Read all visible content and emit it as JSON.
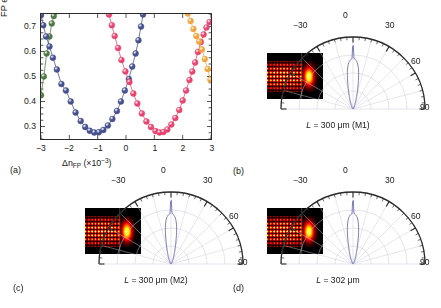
{
  "figure": {
    "panels": [
      "a",
      "b",
      "c",
      "d"
    ],
    "panel_labels": {
      "a": "(a)",
      "b": "(b)",
      "c": "(c)",
      "d": "(d)"
    }
  },
  "chart_data": [
    {
      "panel": "a",
      "type": "scatter",
      "title": "",
      "xlabel": "Δn_FP (×10⁻³)",
      "ylabel": "FP energy ratio R",
      "xlim": [
        -3,
        3
      ],
      "ylim": [
        0.25,
        0.75
      ],
      "xticks": [
        -3,
        -2,
        -1,
        0,
        1,
        2,
        3
      ],
      "yticks": [
        0.3,
        0.4,
        0.5,
        0.6,
        0.7
      ],
      "grid": false,
      "legend": "none",
      "series": [
        {
          "name": "green-branch",
          "color": "#4f7a43",
          "marker": "sphere",
          "x": [
            -3.0,
            -2.9,
            -2.8,
            -2.7,
            -2.62,
            -2.55,
            -2.48
          ],
          "y": [
            0.425,
            0.5,
            0.592,
            0.66,
            0.712,
            0.742,
            0.76
          ]
        },
        {
          "name": "blue-branch",
          "color": "#46508f",
          "marker": "sphere",
          "x": [
            -3.0,
            -2.92,
            -2.82,
            -2.7,
            -2.58,
            -2.44,
            -2.28,
            -2.12,
            -1.95,
            -1.78,
            -1.6,
            -1.44,
            -1.28,
            -1.12,
            -0.96,
            -0.8,
            -0.64,
            -0.48,
            -0.32,
            -0.18,
            -0.04,
            0.1,
            0.22,
            0.34,
            0.44,
            0.53,
            0.6
          ],
          "y": [
            0.745,
            0.705,
            0.66,
            0.62,
            0.575,
            0.528,
            0.47,
            0.444,
            0.4,
            0.356,
            0.322,
            0.298,
            0.283,
            0.276,
            0.277,
            0.286,
            0.304,
            0.33,
            0.362,
            0.4,
            0.444,
            0.49,
            0.54,
            0.592,
            0.645,
            0.7,
            0.748
          ]
        },
        {
          "name": "pink-branch",
          "color": "#e8446f",
          "marker": "sphere",
          "x": [
            -0.6,
            -0.5,
            -0.4,
            -0.28,
            -0.16,
            -0.02,
            0.12,
            0.26,
            0.4,
            0.56,
            0.72,
            0.88,
            1.04,
            1.18,
            1.32,
            1.46,
            1.6,
            1.74,
            1.88,
            2.0,
            2.12,
            2.24,
            2.34,
            2.44,
            2.54,
            2.64,
            2.74,
            2.84,
            2.95
          ],
          "y": [
            0.748,
            0.705,
            0.662,
            0.614,
            0.566,
            0.52,
            0.478,
            0.432,
            0.392,
            0.352,
            0.32,
            0.298,
            0.282,
            0.276,
            0.278,
            0.288,
            0.308,
            0.334,
            0.366,
            0.404,
            0.444,
            0.486,
            0.52,
            0.556,
            0.598,
            0.638,
            0.668,
            0.696,
            0.718
          ]
        },
        {
          "name": "orange-branch",
          "color": "#f0a53c",
          "marker": "sphere",
          "x": [
            2.18,
            2.28,
            2.38,
            2.48,
            2.58,
            2.68,
            2.78,
            2.88,
            2.98
          ],
          "y": [
            0.752,
            0.722,
            0.69,
            0.662,
            0.64,
            0.608,
            0.57,
            0.53,
            0.487
          ]
        }
      ]
    },
    {
      "panel": "b",
      "type": "line",
      "plot_style": "polar-halfcircle",
      "caption": "L = 300 μm (M1)",
      "angle_ticks": [
        -30,
        0,
        30,
        60,
        90
      ],
      "angle_tick_labels": [
        "−30",
        "0",
        "30",
        "60",
        "90"
      ],
      "angle_range": [
        -90,
        90
      ],
      "radial_grid_rings": 4,
      "inset": "near-field-intensity-image",
      "far_field_lobes_deg": [
        -9,
        -4,
        0,
        4,
        9
      ],
      "main_lobe_deg": 0
    },
    {
      "panel": "c",
      "type": "line",
      "plot_style": "polar-halfcircle",
      "caption": "L = 300 μm (M2)",
      "angle_ticks": [
        -30,
        0,
        30,
        60,
        90
      ],
      "angle_tick_labels": [
        "−30",
        "0",
        "30",
        "60",
        "90"
      ],
      "angle_range": [
        -90,
        90
      ],
      "radial_grid_rings": 4,
      "inset": "near-field-intensity-image",
      "far_field_lobes_deg": [
        -6,
        0,
        6
      ],
      "main_lobe_deg": 0
    },
    {
      "panel": "d",
      "type": "line",
      "plot_style": "polar-halfcircle",
      "caption": "L = 302 μm",
      "angle_ticks": [
        -30,
        0,
        30,
        60,
        90
      ],
      "angle_tick_labels": [
        "−30",
        "0",
        "30",
        "60",
        "90"
      ],
      "angle_range": [
        -90,
        90
      ],
      "radial_grid_rings": 4,
      "inset": "near-field-intensity-image",
      "far_field_lobes_deg": [
        -5,
        0,
        5
      ],
      "main_lobe_deg": 0
    }
  ],
  "panel_a": {
    "ylabel_prefix": "FP energy ratio ",
    "ylabel_italic": "R",
    "yticks": [
      "0.7",
      "0.6",
      "0.5",
      "0.4",
      "0.3"
    ],
    "xticks": [
      "−3",
      "−2",
      "−1",
      "0",
      "1",
      "2",
      "3"
    ],
    "xlabel_main": "Δn",
    "xlabel_sub": "FP",
    "xlabel_unit_open": " (×10",
    "xlabel_sup": "−3",
    "xlabel_unit_close": ")",
    "label": "(a)"
  },
  "panel_b": {
    "label": "(b)",
    "caption_italic": "L",
    "caption_rest": " = 300 μm (M1)",
    "ticks": {
      "m30": "−30",
      "zero": "0",
      "p30": "30",
      "p60": "60",
      "p90": "90"
    }
  },
  "panel_c": {
    "label": "(c)",
    "caption_italic": "L",
    "caption_rest": " = 300 μm (M2)",
    "ticks": {
      "m30": "−30",
      "zero": "0",
      "p30": "30",
      "p60": "60",
      "p90": "90"
    }
  },
  "panel_d": {
    "label": "(d)",
    "caption_italic": "L",
    "caption_rest": " = 302 μm",
    "ticks": {
      "m30": "−30",
      "zero": "0",
      "p30": "30",
      "p60": "60",
      "p90": "90"
    }
  },
  "colors": {
    "green": "#4f7a43",
    "blue": "#46508f",
    "pink": "#e8446f",
    "orange": "#f0a53c",
    "axis": "#2b2b2b",
    "polar_curve": "#6d6fae",
    "polar_grid": "#c9c9d8"
  }
}
